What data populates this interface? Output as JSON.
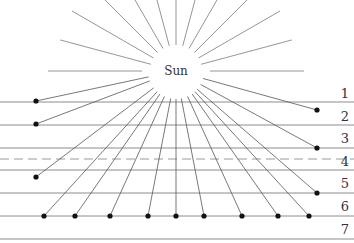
{
  "diagram": {
    "sun_label": "Sun",
    "layer_labels": [
      "1",
      "2",
      "3",
      "4",
      "5",
      "6",
      "7"
    ],
    "sun_center": [
      176,
      71
    ],
    "upper_ray_angles_deg": [
      180,
      195,
      210,
      225,
      240,
      255,
      270,
      285,
      300,
      315,
      330,
      345,
      0
    ],
    "horizontal_lines_y": [
      102,
      125,
      148,
      170,
      193,
      216,
      239
    ],
    "dashed_line_y": 159,
    "side_dots": [
      {
        "x": 36,
        "y": 101
      },
      {
        "x": 36,
        "y": 124
      },
      {
        "x": 36,
        "y": 177
      },
      {
        "x": 317,
        "y": 110
      },
      {
        "x": 317,
        "y": 148
      },
      {
        "x": 317,
        "y": 193
      }
    ],
    "bottom_dots_x": [
      44,
      75,
      110,
      148,
      176,
      204,
      242,
      278,
      309
    ],
    "bottom_dots_y": 216
  }
}
